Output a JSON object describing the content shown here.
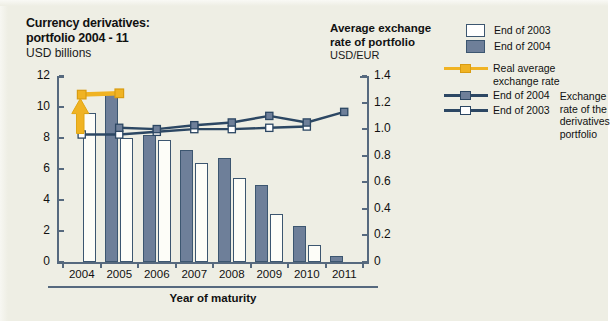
{
  "title": {
    "left_line1": "Currency derivatives:",
    "left_line2": "portfolio 2004 - 11",
    "left_units": "USD billions",
    "right_line1": "Average exchange",
    "right_line2": "rate of portfolio",
    "right_units": "USD/EUR"
  },
  "legend": {
    "bars": [
      {
        "label": "End of 2003",
        "swatch": "light"
      },
      {
        "label": "End of 2004",
        "swatch": "dark"
      }
    ],
    "lines": [
      {
        "label_line1": "Real average",
        "label_line2": "exchange rate",
        "style": "yellow"
      },
      {
        "label": "End of 2004",
        "style": "dark"
      },
      {
        "label": "End of 2003",
        "style": "light"
      }
    ],
    "group_note_l1": "Exchange",
    "group_note_l2": "rate of the",
    "group_note_l3": "derivatives",
    "group_note_l4": "portfolio"
  },
  "axis": {
    "x_title": "Year of maturity",
    "left_ticks": [
      "12",
      "10",
      "8",
      "6",
      "4",
      "2",
      "0"
    ],
    "right_ticks": [
      "1.4",
      "1.2",
      "1.0",
      "0.8",
      "0.6",
      "0.4",
      "0.2",
      "0"
    ]
  },
  "colors": {
    "background": "#eeeee4",
    "bar_light": "#fdfdf8",
    "bar_dark": "#6e7f99",
    "outline": "#3c5670",
    "line_dark": "#2c4763",
    "accent_yellow": "#f0b323",
    "axis": "#56697e"
  },
  "chart_data": {
    "type": "bar",
    "title": "Currency derivatives: portfolio 2004 - 11",
    "subtitle": "USD billions",
    "xlabel": "Year of maturity",
    "ylabel": "USD billions",
    "ylabel_right": "USD/EUR",
    "ylim": [
      0,
      12
    ],
    "ylim_right": [
      0,
      1.4
    ],
    "grid": false,
    "legend_position": "top-right",
    "categories": [
      "2004",
      "2005",
      "2006",
      "2007",
      "2008",
      "2009",
      "2010",
      "2011"
    ],
    "series": [
      {
        "name": "End of 2003",
        "type": "bar",
        "axis": "left",
        "color": "#fdfdf8",
        "values": [
          9.6,
          8.0,
          7.9,
          6.4,
          5.4,
          3.1,
          1.1,
          0.0
        ]
      },
      {
        "name": "End of 2004",
        "type": "bar",
        "axis": "left",
        "color": "#6e7f99",
        "values": [
          0.0,
          10.9,
          8.2,
          7.2,
          6.7,
          5.0,
          2.3,
          0.4
        ]
      },
      {
        "name": "End of 2003 (exchange rate of the derivatives portfolio)",
        "type": "line",
        "axis": "right",
        "color": "#2c4763",
        "marker": "white-square",
        "values": [
          0.96,
          0.96,
          0.98,
          1.0,
          1.0,
          1.01,
          1.02,
          null
        ]
      },
      {
        "name": "End of 2004 (exchange rate of the derivatives portfolio)",
        "type": "line",
        "axis": "right",
        "color": "#2c4763",
        "marker": "dark-square",
        "values": [
          null,
          1.01,
          1.0,
          1.03,
          1.05,
          1.1,
          1.05,
          1.13
        ]
      },
      {
        "name": "Real average exchange rate",
        "type": "line",
        "axis": "right",
        "color": "#f0b323",
        "marker": "yellow-square",
        "values": [
          1.26,
          1.27,
          null,
          null,
          null,
          null,
          null,
          null
        ]
      }
    ],
    "annotations": [
      {
        "type": "arrow",
        "color": "#f0b323",
        "at_category": "2004",
        "note": "upward arrow from End of 2003 marker to real average exchange rate"
      }
    ]
  }
}
